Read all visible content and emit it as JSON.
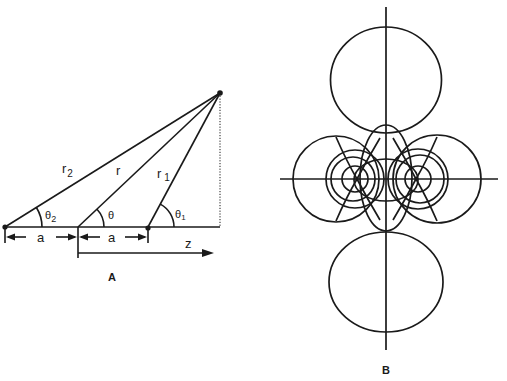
{
  "figure": {
    "panels": [
      {
        "id": "A",
        "label": "A",
        "description": "Geometry of two point sources separated by 2a along the z axis",
        "labels": {
          "r2": "r",
          "r2_sub": "2",
          "r": "r",
          "r1": "r",
          "r1_sub": "1",
          "theta2": "θ",
          "theta2_sub": "2",
          "theta": "θ",
          "theta1": "θ",
          "theta1_sub": "1",
          "a_left": "a",
          "a_right": "a",
          "z": "z"
        }
      },
      {
        "id": "B",
        "label": "B",
        "description": "Family of lobes/field contours around two source points on a horizontal axis"
      }
    ],
    "colors": {
      "ink": "#1a1a1a",
      "background": "#ffffff"
    }
  }
}
